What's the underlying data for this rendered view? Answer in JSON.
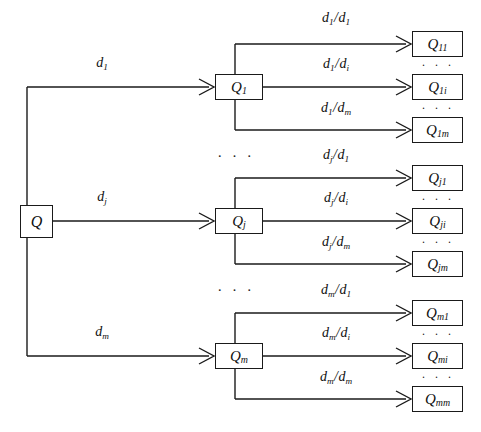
{
  "diagram": {
    "type": "tree-diagram",
    "colors": {
      "stroke": "#1a1a1a",
      "background": "#ffffff",
      "text": "#101010"
    },
    "root": {
      "label_base": "Q",
      "label_sub": ""
    },
    "level1": [
      {
        "label_base": "Q",
        "label_sub": "1",
        "edge_label_base": "d",
        "edge_label_sub": "1"
      },
      {
        "label_base": "Q",
        "label_sub": "j",
        "edge_label_base": "d",
        "edge_label_sub": "j"
      },
      {
        "label_base": "Q",
        "label_sub": "m",
        "edge_label_base": "d",
        "edge_label_sub": "m"
      }
    ],
    "level2": [
      {
        "group": "1",
        "children": [
          {
            "label_base": "Q",
            "label_sub": "11",
            "edge_num_base": "d",
            "edge_num_sub": "1",
            "edge_den_base": "d",
            "edge_den_sub": "1"
          },
          {
            "label_base": "Q",
            "label_sub": "1i",
            "edge_num_base": "d",
            "edge_num_sub": "1",
            "edge_den_base": "d",
            "edge_den_sub": "i"
          },
          {
            "label_base": "Q",
            "label_sub": "1m",
            "edge_num_base": "d",
            "edge_num_sub": "1",
            "edge_den_base": "d",
            "edge_den_sub": "m"
          }
        ]
      },
      {
        "group": "j",
        "children": [
          {
            "label_base": "Q",
            "label_sub": "j1",
            "edge_num_base": "d",
            "edge_num_sub": "j",
            "edge_den_base": "d",
            "edge_den_sub": "1"
          },
          {
            "label_base": "Q",
            "label_sub": "ji",
            "edge_num_base": "d",
            "edge_num_sub": "j",
            "edge_den_base": "d",
            "edge_den_sub": "i"
          },
          {
            "label_base": "Q",
            "label_sub": "jm",
            "edge_num_base": "d",
            "edge_num_sub": "j",
            "edge_den_base": "d",
            "edge_den_sub": "m"
          }
        ]
      },
      {
        "group": "m",
        "children": [
          {
            "label_base": "Q",
            "label_sub": "m1",
            "edge_num_base": "d",
            "edge_num_sub": "m",
            "edge_den_base": "d",
            "edge_den_sub": "1"
          },
          {
            "label_base": "Q",
            "label_sub": "mi",
            "edge_num_base": "d",
            "edge_num_sub": "m",
            "edge_den_base": "d",
            "edge_den_sub": "i"
          },
          {
            "label_base": "Q",
            "label_sub": "mm",
            "edge_num_base": "d",
            "edge_num_sub": "m",
            "edge_den_base": "d",
            "edge_den_sub": "m"
          }
        ]
      }
    ],
    "ellipses": {
      "glyph": "· · ·",
      "mid_column": [
        "between-q1-and-qj",
        "between-qj-and-qm"
      ],
      "right_column": [
        "between-q11-and-q1i",
        "between-q1i-and-q1m",
        "between-qj1-and-qji",
        "between-qji-and-qjm",
        "between-qm1-and-qmi",
        "between-qmi-and-qmm"
      ]
    },
    "separator_slash": "/"
  }
}
